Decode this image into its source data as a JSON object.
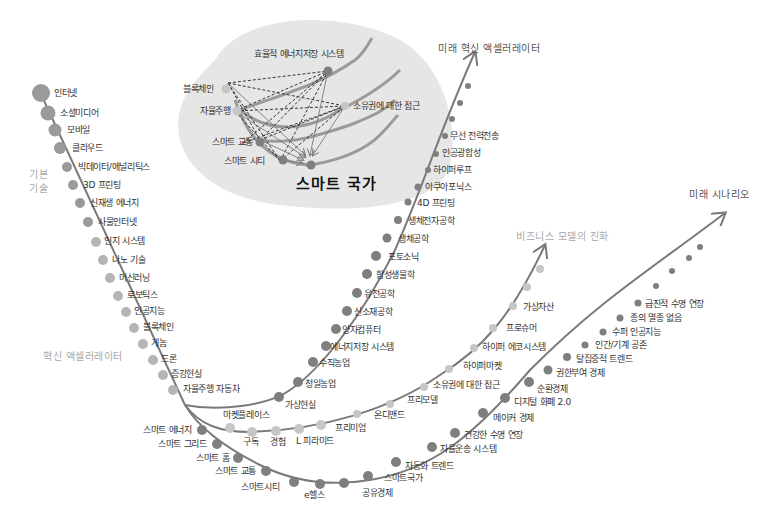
{
  "colors": {
    "blob": "#e6e6e6",
    "line": "#7a7a7a",
    "dot_dark": "#7f7f7f",
    "dot_mid": "#9a9a9a",
    "dot_light": "#c6c6c6",
    "text": "#333333",
    "section_light": "#a8a8a8"
  },
  "titles": {
    "basic_tech": "기본\n기술",
    "basic_tech_line1": "기본",
    "basic_tech_line2": "기술",
    "innovation_accelerator": "혁신 액셀러레이터",
    "future_innovation_accelerator": "미래 혁신 액셀러레이터",
    "business_model_evolution": "비즈니스 모델의 진화",
    "future_scenario": "미래 시나리오"
  },
  "inset": {
    "title": "스마트 국가",
    "nodes": [
      {
        "label": "효율적 에너지저장 시스템"
      },
      {
        "label": "블록체인"
      },
      {
        "label": "자율주행"
      },
      {
        "label": "소유권에 대한 접근"
      },
      {
        "label": "스마트 교통"
      },
      {
        "label": "스마트 시티"
      }
    ]
  },
  "basic_technologies": [
    "인터넷",
    "소셜미디어",
    "모바일",
    "클라우드",
    "빅데이터/애널리틱스",
    "3D 프린팅",
    "신재생 에너지",
    "사물인터넷",
    "인지 시스템",
    "나노 기술",
    "머신러닝",
    "로보틱스",
    "인공지능",
    "블록체인",
    "게놈",
    "드론",
    "증강현실",
    "자율주행 자동차"
  ],
  "future_accelerators": [
    "가상현실",
    "청일농업",
    "수직농업",
    "에너지저장 시스템",
    "양자컴퓨터",
    "신소재공학",
    "유전공학",
    "합성생물학",
    "포토소닉",
    "생체공학",
    "생체전자공학",
    "4D 프린팅",
    "아쿠아포닉스",
    "하이퍼루프",
    "인공광합성",
    "무선 전력전송"
  ],
  "business_models": [
    "마켓플레이스",
    "구독",
    "경험",
    "L 피라미드",
    "프리미엄",
    "온디맨드",
    "프리모델",
    "소유권에 대한 접근",
    "하이퍼마켓",
    "하이퍼 에코시스템",
    "프로슈머",
    "가상자산"
  ],
  "future_scenarios": [
    "스마트 에너지",
    "스마트 그리드",
    "스마트 홈",
    "스마트 교통",
    "스마트시티",
    "e헬스",
    "공유경제",
    "스마트국가",
    "자동화 트렌드",
    "자율운송 시스템",
    "건강한 수명 연장",
    "메이커 경제",
    "디지털 화폐 2.0",
    "순환경제",
    "권한부여 경제",
    "탈집중적 트렌드",
    "인간/기계 공존",
    "수퍼 인공지능",
    "종의 멸종 없음",
    "급진적 수명 연장"
  ]
}
